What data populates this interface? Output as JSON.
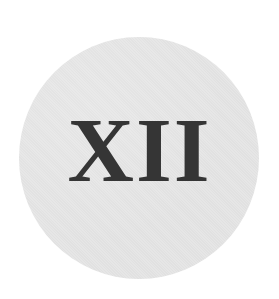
{
  "emblem": {
    "text": "XII",
    "disc_color": "#e6e6e6",
    "text_color": "#353535"
  }
}
